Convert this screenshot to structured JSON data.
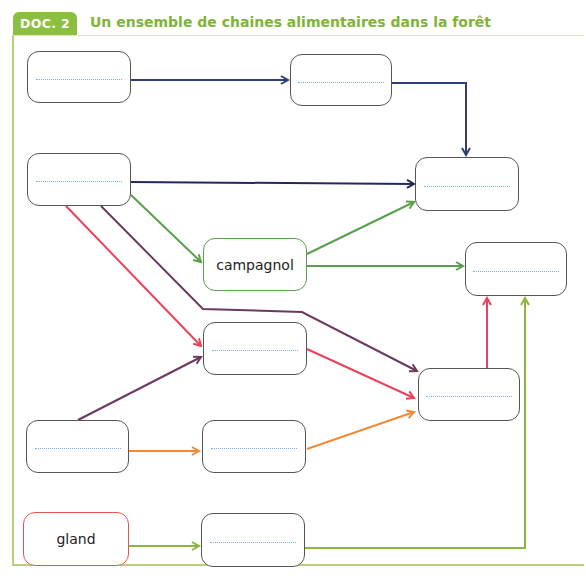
{
  "header": {
    "badge": "DOC. 2",
    "title": "Un ensemble de chaines alimentaires dans la forêt"
  },
  "colors": {
    "brand_green": "#8cbf3f",
    "navy": "#2f3f7a",
    "dark_navy": "#232a5a",
    "green": "#5aa04a",
    "red": "#e8435a",
    "purple": "#6b3a5e",
    "orange": "#f08a3a",
    "light_green": "#8ab83c",
    "blank_dots": "#7fb3e0"
  },
  "nodes": [
    {
      "id": "n1",
      "label": "",
      "blank": true
    },
    {
      "id": "n2",
      "label": "",
      "blank": true
    },
    {
      "id": "n3",
      "label": "",
      "blank": true
    },
    {
      "id": "n4",
      "label": "",
      "blank": true
    },
    {
      "id": "n5",
      "label": "campagnol",
      "blank": false
    },
    {
      "id": "n6",
      "label": "",
      "blank": true
    },
    {
      "id": "n7",
      "label": "",
      "blank": true
    },
    {
      "id": "n8",
      "label": "",
      "blank": true
    },
    {
      "id": "n9",
      "label": "",
      "blank": true
    },
    {
      "id": "n10",
      "label": "",
      "blank": true
    },
    {
      "id": "n11",
      "label": "gland",
      "blank": false
    },
    {
      "id": "n12",
      "label": "",
      "blank": true
    }
  ],
  "edges": [
    {
      "from": "n1",
      "to": "n2",
      "color": "navy"
    },
    {
      "from": "n2",
      "to": "n4",
      "color": "navy"
    },
    {
      "from": "n3",
      "to": "n4",
      "color": "dark_navy"
    },
    {
      "from": "n3",
      "to": "n5",
      "color": "green"
    },
    {
      "from": "n5",
      "to": "n4",
      "color": "green"
    },
    {
      "from": "n5",
      "to": "n6",
      "color": "green"
    },
    {
      "from": "n3",
      "to": "n7",
      "color": "red"
    },
    {
      "from": "n3",
      "to": "n8",
      "color": "purple"
    },
    {
      "from": "n7",
      "to": "n8",
      "color": "red"
    },
    {
      "from": "n8",
      "to": "n6",
      "color": "red"
    },
    {
      "from": "n9",
      "to": "n7",
      "color": "purple"
    },
    {
      "from": "n9",
      "to": "n10",
      "color": "orange"
    },
    {
      "from": "n10",
      "to": "n8",
      "color": "orange"
    },
    {
      "from": "n11",
      "to": "n12",
      "color": "light_green"
    },
    {
      "from": "n12",
      "to": "n6",
      "color": "light_green"
    }
  ]
}
